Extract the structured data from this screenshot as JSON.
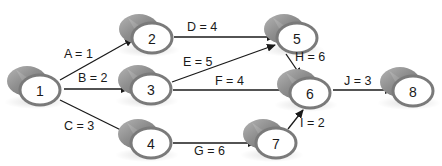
{
  "diagram": {
    "type": "activity-on-node network / project network",
    "colors": {
      "node_body": "#8c8c8c",
      "node_face": "#ffffff",
      "node_rim": "#7a7a7a",
      "edge": "#1a1a1a",
      "text": "#1a1a1a"
    },
    "nodes": [
      {
        "id": "1",
        "label": "1",
        "cx": 40,
        "cy": 90
      },
      {
        "id": "2",
        "label": "2",
        "cx": 152,
        "cy": 38
      },
      {
        "id": "3",
        "label": "3",
        "cx": 151,
        "cy": 89
      },
      {
        "id": "4",
        "label": "4",
        "cx": 151,
        "cy": 143
      },
      {
        "id": "5",
        "label": "5",
        "cx": 297,
        "cy": 38
      },
      {
        "id": "6",
        "label": "6",
        "cx": 310,
        "cy": 93
      },
      {
        "id": "7",
        "label": "7",
        "cx": 276,
        "cy": 143
      },
      {
        "id": "8",
        "label": "8",
        "cx": 413,
        "cy": 91
      }
    ],
    "edges": [
      {
        "id": "A",
        "label": "A = 1",
        "from": "1",
        "to": "2",
        "x1": 60,
        "y1": 80,
        "x2": 133,
        "y2": 39,
        "lx": 64,
        "ly": 58
      },
      {
        "id": "B",
        "label": "B = 2",
        "from": "1",
        "to": "3",
        "x1": 64,
        "y1": 89,
        "x2": 129,
        "y2": 89,
        "lx": 78,
        "ly": 82
      },
      {
        "id": "C",
        "label": "C = 3",
        "from": "1",
        "to": "4",
        "x1": 60,
        "y1": 100,
        "x2": 133,
        "y2": 136,
        "lx": 64,
        "ly": 130
      },
      {
        "id": "D",
        "label": "D = 4",
        "from": "2",
        "to": "5",
        "x1": 174,
        "y1": 37,
        "x2": 275,
        "y2": 37,
        "lx": 187,
        "ly": 31
      },
      {
        "id": "E",
        "label": "E = 5",
        "from": "3",
        "to": "5",
        "x1": 172,
        "y1": 82,
        "x2": 275,
        "y2": 45,
        "lx": 183,
        "ly": 66
      },
      {
        "id": "F",
        "label": "F = 4",
        "from": "3",
        "to": "6",
        "x1": 173,
        "y1": 90,
        "x2": 291,
        "y2": 90,
        "lx": 215,
        "ly": 85
      },
      {
        "id": "G",
        "label": "G = 6",
        "from": "4",
        "to": "7",
        "x1": 173,
        "y1": 143,
        "x2": 256,
        "y2": 143,
        "lx": 194,
        "ly": 155
      },
      {
        "id": "H",
        "label": "H = 6",
        "from": "5",
        "to": "6",
        "x1": 286,
        "y1": 54,
        "x2": 301,
        "y2": 76,
        "lx": 295,
        "ly": 61
      },
      {
        "id": "I",
        "label": "I = 2",
        "from": "7",
        "to": "6",
        "x1": 288,
        "y1": 129,
        "x2": 303,
        "y2": 110,
        "lx": 300,
        "ly": 127
      },
      {
        "id": "J",
        "label": "J = 3",
        "from": "6",
        "to": "8",
        "x1": 333,
        "y1": 90,
        "x2": 393,
        "y2": 90,
        "lx": 344,
        "ly": 85
      }
    ]
  }
}
